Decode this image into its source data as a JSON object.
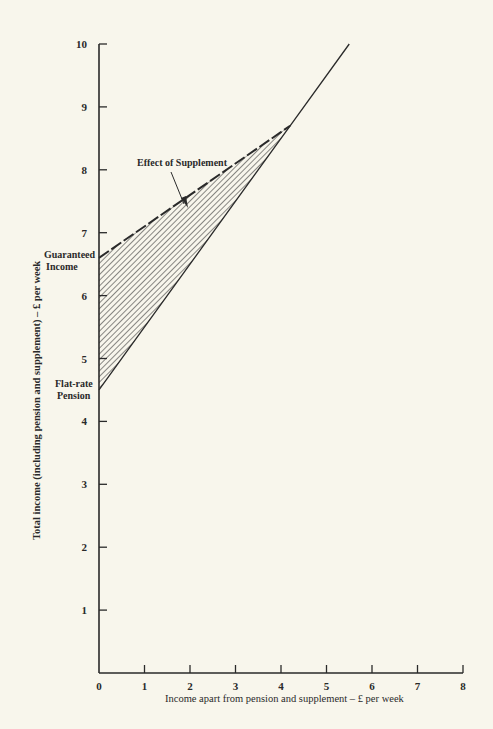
{
  "chart_data": {
    "type": "area",
    "title": "",
    "xlabel": "Income apart from pension and supplement – £ per week",
    "ylabel": "Total income (including pension and supplement) – £ per week",
    "xlim": [
      0,
      8
    ],
    "ylim": [
      0,
      10
    ],
    "x_ticks": [
      "0",
      "1",
      "2",
      "3",
      "4",
      "5",
      "6",
      "7",
      "8"
    ],
    "y_ticks": [
      "1",
      "2",
      "3",
      "4",
      "5",
      "6",
      "7",
      "8",
      "9",
      "10"
    ],
    "grid": false,
    "legend": null,
    "series": [
      {
        "name": "Flat-rate pension + other income",
        "style": "solid",
        "x": [
          0,
          4.2,
          5.5
        ],
        "y": [
          4.5,
          8.7,
          10.0
        ]
      },
      {
        "name": "With supplement (guaranteed income)",
        "style": "dashed",
        "x": [
          0,
          4.2
        ],
        "y": [
          6.6,
          8.7
        ]
      }
    ],
    "shaded_region": {
      "label": "Effect of Supplement",
      "fill": "diagonal-hatch",
      "between": [
        "With supplement (guaranteed income)",
        "Flat-rate pension + other income"
      ],
      "x_range": [
        0,
        4.2
      ]
    },
    "annotations": [
      {
        "text": "Guaranteed Income",
        "lines": [
          "Guaranteed",
          "Income"
        ],
        "x": 0,
        "y": 6.6
      },
      {
        "text": "Flat-rate Pension",
        "lines": [
          "Flat-rate",
          "Pension"
        ],
        "x": 0,
        "y": 4.5
      },
      {
        "text": "Effect of Supplement",
        "x": 2.3,
        "y": 7.3,
        "arrow": true
      }
    ]
  },
  "labels": {
    "guaranteed_1": "Guaranteed",
    "guaranteed_2": "Income",
    "flatrate_1": "Flat-rate",
    "flatrate_2": "Pension",
    "effect": "Effect of Supplement",
    "xlabel": "Income apart from pension and supplement – £ per week",
    "ylabel": "Total income (including pension and supplement) – £ per week"
  }
}
